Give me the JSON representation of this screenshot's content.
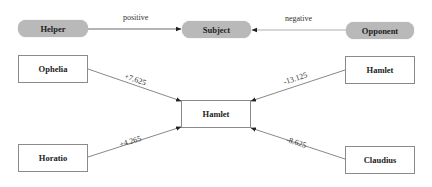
{
  "diagram": {
    "type": "actantial-model",
    "top_row": {
      "helper": {
        "label": "Helper"
      },
      "subject": {
        "label": "Subject"
      },
      "opponent": {
        "label": "Opponent"
      },
      "edges": [
        {
          "from": "Helper",
          "to": "Subject",
          "label": "positive"
        },
        {
          "from": "Opponent",
          "to": "Subject",
          "label": "negative"
        }
      ]
    },
    "nodes": {
      "center": {
        "label": "Hamlet"
      },
      "top_left": {
        "label": "Ophelia"
      },
      "top_right": {
        "label": "Hamlet"
      },
      "bottom_left": {
        "label": "Horatio"
      },
      "bottom_right": {
        "label": "Claudius"
      }
    },
    "edges": [
      {
        "from": "Ophelia",
        "to": "Hamlet",
        "label": "+7.625"
      },
      {
        "from": "Hamlet",
        "to": "Hamlet",
        "label": "-13.125"
      },
      {
        "from": "Horatio",
        "to": "Hamlet",
        "label": "+4.265"
      },
      {
        "from": "Claudius",
        "to": "Hamlet",
        "label": "-8.625"
      }
    ],
    "colors": {
      "pill_fill": "#b9b9b9",
      "box_border": "#8a8a8a",
      "edge_line": "#444444",
      "background": "#ffffff"
    }
  }
}
